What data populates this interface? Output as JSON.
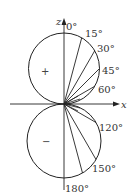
{
  "diagram": {
    "type": "polar-lobe-diagram",
    "axes": {
      "vertical_label": "z",
      "horizontal_label": "x"
    },
    "lobes": [
      {
        "name": "upper",
        "sign": "+"
      },
      {
        "name": "lower",
        "sign": "−"
      }
    ],
    "angle_labels": [
      "0°",
      "15°",
      "30°",
      "45°",
      "60°",
      "120°",
      "150°",
      "180°"
    ],
    "angles_deg": [
      0,
      15,
      30,
      45,
      60,
      120,
      150,
      180
    ],
    "colors": {
      "stroke": "#222222",
      "background": "#ffffff"
    }
  }
}
